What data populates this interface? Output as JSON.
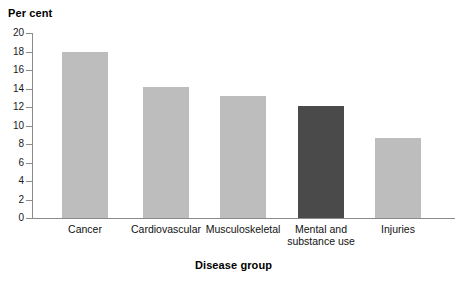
{
  "chart_data": {
    "type": "bar",
    "title": "",
    "ylabel": "Per cent",
    "xlabel": "Disease group",
    "categories": [
      "Cancer",
      "Cardiovascular",
      "Musculoskeletal",
      "Mental and\nsubstance use",
      "Injuries"
    ],
    "values": [
      18.0,
      14.2,
      13.2,
      12.1,
      8.7
    ],
    "ylim": [
      0,
      20
    ],
    "ytick_labels": [
      "0",
      "2",
      "4",
      "6",
      "8",
      "10",
      "12",
      "14",
      "16",
      "18",
      "20"
    ],
    "ytick_values": [
      0,
      2,
      4,
      6,
      8,
      10,
      12,
      14,
      16,
      18,
      20
    ],
    "grid": false,
    "legend": "none",
    "bar_colors": [
      "#bdbdbd",
      "#bdbdbd",
      "#bdbdbd",
      "#4a4a4a",
      "#bdbdbd"
    ],
    "highlight_category": "Mental and substance use",
    "colors": {
      "bar_normal": "#bdbdbd",
      "bar_highlight": "#4a4a4a",
      "axis": "#8b8b8b",
      "text": "#111111",
      "background": "#ffffff"
    }
  }
}
